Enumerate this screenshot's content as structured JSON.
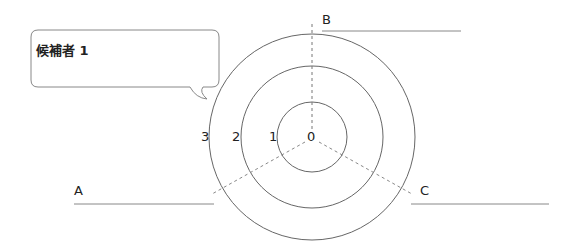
{
  "callout": {
    "text": "候補者 1"
  },
  "rings": {
    "center_label": "0",
    "labels": [
      "1",
      "2",
      "3"
    ]
  },
  "axes": [
    {
      "label": "A"
    },
    {
      "label": "B"
    },
    {
      "label": "C"
    }
  ],
  "colors": {
    "line": "#666666",
    "dash": "#888888",
    "text": "#222222"
  }
}
